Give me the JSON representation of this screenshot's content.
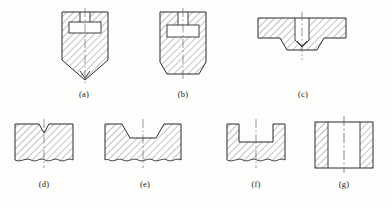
{
  "sheet": {
    "background_color": "#fdfdfb",
    "line_color": "#2b2b2b",
    "hatch_color": "#4a4a4a",
    "centerline_color": "#555555",
    "width": 392,
    "height": 208,
    "description": "Engineering sectional-view drawing sheet with seven hatched cross-section figures labelled (a) through (g)"
  },
  "figures": [
    {
      "id": "a",
      "caption": "(a)",
      "caption_x": 84,
      "caption_y": 95,
      "shape": "block-with-pointed-V-bottom",
      "features": [
        "top center slot",
        "internal rectangular cavity",
        "sectional hatching",
        "vertical centerline",
        "V pointed bottom"
      ],
      "bbox": {
        "x": 62,
        "y": 12,
        "w": 48,
        "h": 68
      }
    },
    {
      "id": "b",
      "caption": "(b)",
      "caption_x": 183,
      "caption_y": 95,
      "shape": "block-with-chamfered-bottom-corners",
      "features": [
        "top center slot",
        "internal rectangular cavity",
        "sectional hatching",
        "vertical centerline",
        "chamfered lower corners"
      ],
      "bbox": {
        "x": 160,
        "y": 12,
        "w": 48,
        "h": 62
      }
    },
    {
      "id": "c",
      "caption": "(c)",
      "caption_x": 303,
      "caption_y": 95,
      "shape": "wide-flange-with-central-blind-slot",
      "features": [
        "wide flat flange",
        "central blind slot with V bottom",
        "lower boss with chamfers",
        "sectional hatching",
        "vertical centerline"
      ],
      "bbox": {
        "x": 258,
        "y": 14,
        "w": 90,
        "h": 38
      }
    },
    {
      "id": "d",
      "caption": "(d)",
      "caption_x": 44,
      "caption_y": 185,
      "shape": "rectangle-with-narrow-V-notch",
      "features": [
        "narrow V notch at top",
        "sectional hatching",
        "vertical centerline",
        "wavy break line at bottom"
      ],
      "bbox": {
        "x": 14,
        "y": 122,
        "w": 62,
        "h": 42
      }
    },
    {
      "id": "e",
      "caption": "(e)",
      "caption_x": 145,
      "caption_y": 185,
      "shape": "rectangle-with-trapezoidal-notch",
      "features": [
        "wide trapezoidal notch at top",
        "sectional hatching",
        "vertical centerline",
        "wavy break line at bottom"
      ],
      "bbox": {
        "x": 104,
        "y": 122,
        "w": 76,
        "h": 42
      }
    },
    {
      "id": "f",
      "caption": "(f)",
      "caption_x": 256,
      "caption_y": 185,
      "shape": "rectangle-with-rectangular-notch",
      "features": [
        "square notch at top",
        "sectional hatching",
        "vertical centerline",
        "wavy break line at bottom"
      ],
      "bbox": {
        "x": 226,
        "y": 122,
        "w": 58,
        "h": 42
      }
    },
    {
      "id": "g",
      "caption": "(g)",
      "caption_x": 344,
      "caption_y": 185,
      "shape": "hollow-tube-section",
      "features": [
        "hatched left wall",
        "hatched right wall",
        "unhatched bore",
        "dash-dot vertical centerline"
      ],
      "bbox": {
        "x": 314,
        "y": 120,
        "w": 58,
        "h": 50
      }
    }
  ]
}
